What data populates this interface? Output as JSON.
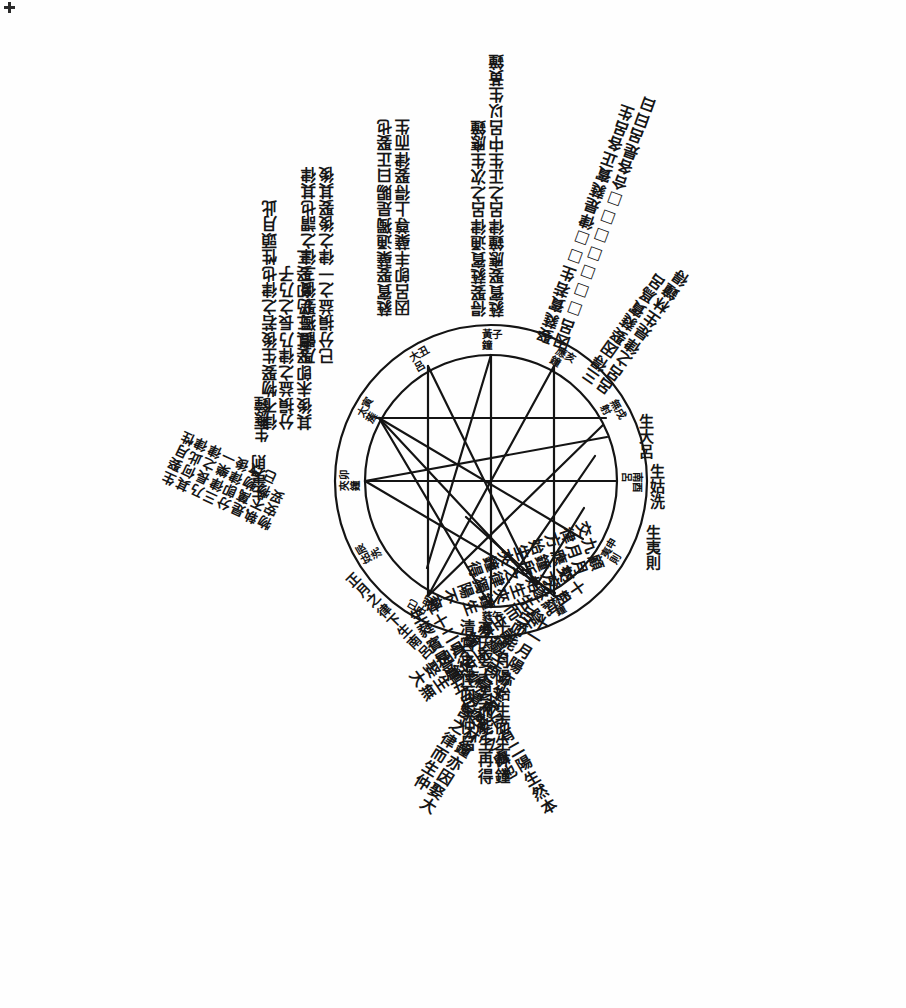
{
  "page": {
    "background_color": "#fefefe",
    "ink_color": "#141414",
    "width": 906,
    "height": 1008
  },
  "wheel": {
    "outer_ring_label": "十二律呂十二辰環",
    "ring_entries": [
      {
        "pitch": "黃鐘",
        "branch": "子",
        "angle_deg": 90,
        "upright": true
      },
      {
        "pitch": "大呂",
        "branch": "丑",
        "angle_deg": 120,
        "upright": true
      },
      {
        "pitch": "太蔟",
        "branch": "寅",
        "angle_deg": 150,
        "upright": true
      },
      {
        "pitch": "夾鐘",
        "branch": "卯",
        "angle_deg": 180,
        "upright": true
      },
      {
        "pitch": "姑洗",
        "branch": "辰",
        "angle_deg": 210,
        "upright": true
      },
      {
        "pitch": "中呂",
        "branch": "巳",
        "angle_deg": 240,
        "upright": true
      },
      {
        "pitch": "蕤賓",
        "branch": "午",
        "angle_deg": 270,
        "upright": false
      },
      {
        "pitch": "林鐘",
        "branch": "未",
        "angle_deg": 300,
        "upright": false
      },
      {
        "pitch": "夷則",
        "branch": "申",
        "angle_deg": 330,
        "upright": false
      },
      {
        "pitch": "南呂",
        "branch": "酉",
        "angle_deg": 0,
        "upright": true
      },
      {
        "pitch": "無射",
        "branch": "戌",
        "angle_deg": 30,
        "upright": true
      },
      {
        "pitch": "應鐘",
        "branch": "亥",
        "angle_deg": 60,
        "upright": true
      }
    ]
  },
  "spoke_heads": [
    {
      "text": "生大呂",
      "angle_deg": 20,
      "radius": 196,
      "rot": 0
    },
    {
      "text": "生姑洗",
      "angle_deg": 5,
      "radius": 196,
      "rot": 0
    },
    {
      "text": "生夷則",
      "angle_deg": 347,
      "radius": 196,
      "rot": 0
    },
    {
      "text": "生應鐘",
      "angle_deg": 168,
      "radius": 186,
      "rot": 180
    },
    {
      "text": "生夷則",
      "angle_deg": 186,
      "radius": 186,
      "rot": 180
    }
  ],
  "rays": [
    {
      "id": "ray-se-1",
      "angle_deg": 272,
      "radius": 138,
      "rot": 0,
      "size": "normal",
      "columns": [
        "清宮之律而生仲呂",
        "亦因娶大呂而能生再得",
        "十一月陽始生而生林鐘"
      ]
    },
    {
      "id": "ray-sse-2",
      "angle_deg": 300,
      "radius": 140,
      "rot": 32,
      "size": "normal",
      "columns": [
        "呂而能生再得清宮之律而生仲",
        "十一月陽亦生而生林鐘亦因娶大"
      ]
    },
    {
      "id": "ray-ese-3",
      "angle_deg": 325,
      "radius": 140,
      "rot": 55,
      "size": "normal",
      "columns": [
        "射交遂生而生林鐘亦因娶大",
        "十月純陰不能獨生夾鐘生無"
      ]
    },
    {
      "id": "ray-e-4",
      "angle_deg": 345,
      "radius": 140,
      "rot": 70,
      "size": "normal",
      "columns": [
        "交律方始生夾鐘得",
        "九月應鐘所之律獨陽不交",
        "顧月交方始生夾鐘生"
      ]
    },
    {
      "id": "ray-sw-5",
      "angle_deg": 250,
      "radius": 140,
      "rot": 330,
      "size": "normal",
      "columns": [
        "生蕤賓是爲五月陰生之處也",
        "律十二月從陰之內巳有二陽生然本"
      ]
    },
    {
      "id": "ray-wsw-6",
      "angle_deg": 222,
      "radius": 150,
      "rot": 315,
      "size": "small",
      "columns": [
        "正月之律下生南呂"
      ]
    },
    {
      "id": "ray-nw-7",
      "angle_deg": 160,
      "radius": 148,
      "rot": 180,
      "size": "normal",
      "columns": [
        "其後未卽娶其三仍卽娶三",
        "分損益之律乃長之乃子",
        "律不物娶生後若之律也性頭月此"
      ]
    },
    {
      "id": "ray-wnw-8",
      "angle_deg": 196,
      "radius": 190,
      "rot": 205,
      "size": "small",
      "columns": [
        "物安妥",
        "執不物已",
        "是萬物改",
        "分卽律後",
        "三律樂一",
        "乃長之律",
        "其何此律",
        "生娶月性"
      ]
    },
    {
      "id": "ray-nnw-9",
      "angle_deg": 135,
      "radius": 165,
      "rot": 180,
      "size": "normal",
      "columns": [
        "已分損益之一律之後娶其後",
        "乃體獨娶後三律之謂也其律"
      ]
    },
    {
      "id": "ray-n-10",
      "angle_deg": 104,
      "radius": 170,
      "rot": 180,
      "size": "normal",
      "columns": [
        "因呂卽丰蘗尊上得娶律而生",
        "蕤賓娶蘗通獨是賜曰正娶也"
      ]
    },
    {
      "id": "ray-nne-11",
      "angle_deg": 72,
      "radius": 172,
      "rot": 180,
      "size": "normal",
      "columns": [
        "蕤賓娶應鐘律呂之正生中呂以生黃鐘",
        "得娶蕤賓通律呂之次生應鐘"
      ]
    },
    {
      "id": "ray-ne-12",
      "angle_deg": 48,
      "radius": 172,
      "rot": 200,
      "size": "normal",
      "columns": [
        "因呂□□□□□□□合各是呂曰曰",
        "娶蕤賓若生□□律是蕤賓正各呂生"
      ]
    },
    {
      "id": "ray-ene-13",
      "angle_deg": 28,
      "radius": 175,
      "rot": 215,
      "size": "normal",
      "columns": [
        "呂呂之律是生林鐘得",
        "三得因娶蕤賓爲呂"
      ]
    }
  ]
}
